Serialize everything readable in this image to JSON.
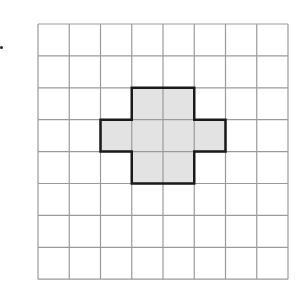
{
  "grid": {
    "cols": 8,
    "rows": 8,
    "origin_x": 38,
    "origin_y": 24,
    "cell_w": 31.25,
    "cell_h": 31.9,
    "line_color": "#9a9a9a"
  },
  "shape": {
    "name": "plus-cross",
    "fill": "#e3e3e3",
    "stroke": "#1a1a1a",
    "cells": [
      [
        3,
        2
      ],
      [
        4,
        2
      ],
      [
        2,
        3
      ],
      [
        3,
        3
      ],
      [
        4,
        3
      ],
      [
        5,
        3
      ],
      [
        3,
        4
      ],
      [
        4,
        4
      ]
    ]
  }
}
